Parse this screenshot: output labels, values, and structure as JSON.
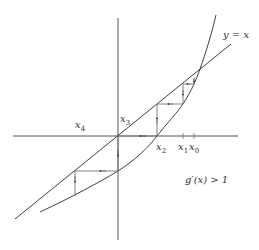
{
  "diagram": {
    "type": "fixed-point-iteration-cobweb",
    "colors": {
      "stroke": "#2a2a2a",
      "cobweb": "#777777",
      "text": "#333333",
      "background": "#ffffff"
    },
    "labels": {
      "line": "y = x",
      "condition": "g′(x) > 1",
      "x0": "x",
      "x0_sub": "0",
      "x1": "x",
      "x1_sub": "1",
      "x2": "x",
      "x2_sub": "2",
      "x3": "x",
      "x3_sub": "3",
      "x4": "x",
      "x4_sub": "4"
    }
  }
}
